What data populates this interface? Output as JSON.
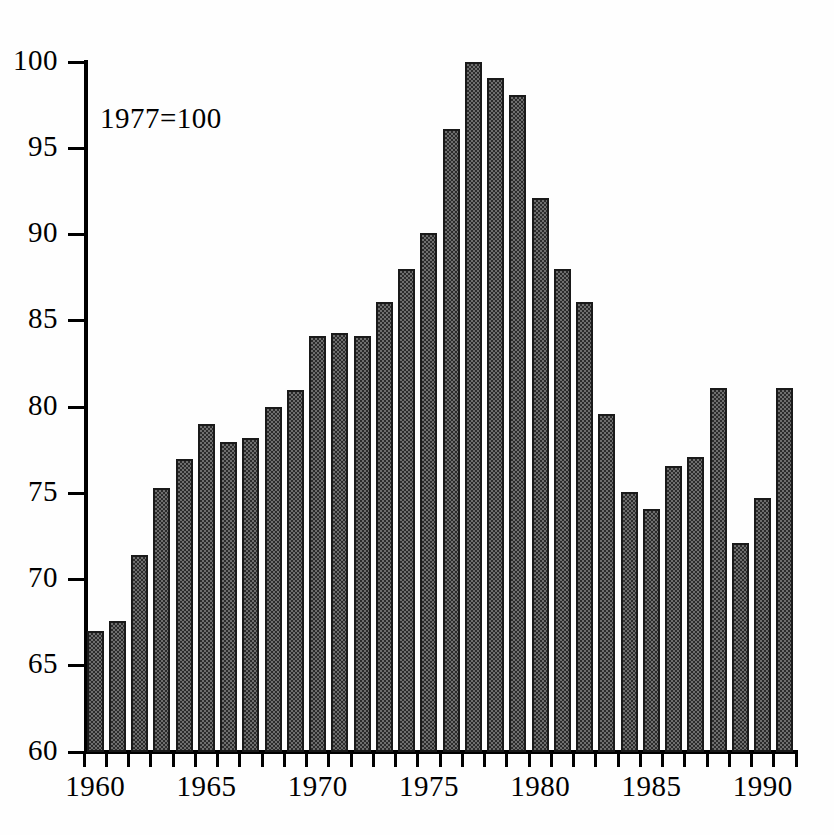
{
  "chart_data": {
    "type": "bar",
    "title": "",
    "subtitle": "",
    "annotation": "1977=100",
    "xlabel": "",
    "ylabel": "",
    "ylim": [
      60,
      100
    ],
    "ytick_values": [
      60,
      65,
      70,
      75,
      80,
      85,
      90,
      95,
      100
    ],
    "ytick_labels": [
      "60",
      "65",
      "70",
      "75",
      "80",
      "85",
      "90",
      "95",
      "100"
    ],
    "xlim": [
      1959.5,
      1991.5
    ],
    "xtick_values": [
      1960,
      1965,
      1970,
      1975,
      1980,
      1985,
      1990
    ],
    "xtick_labels": [
      "1960",
      "1965",
      "1970",
      "1975",
      "1980",
      "1985",
      "1990"
    ],
    "xtick_minor_every": 1,
    "grid": false,
    "legend": null,
    "baseline": 60,
    "bar_color": "#4a4a4a",
    "bar_edge_color": "#1a1a1a",
    "bar_fill_pattern": "checkered-dither",
    "categories": [
      "1960",
      "1961",
      "1962",
      "1963",
      "1964",
      "1965",
      "1966",
      "1967",
      "1968",
      "1969",
      "1970",
      "1971",
      "1972",
      "1973",
      "1974",
      "1975",
      "1976",
      "1977",
      "1978",
      "1979",
      "1980",
      "1981",
      "1982",
      "1983",
      "1984",
      "1985",
      "1986",
      "1987",
      "1988",
      "1989",
      "1990",
      "1991"
    ],
    "values": [
      67.0,
      67.6,
      71.4,
      75.3,
      77.0,
      79.0,
      78.0,
      78.2,
      80.0,
      81.0,
      84.1,
      84.3,
      84.1,
      86.1,
      88.0,
      90.1,
      96.1,
      100.0,
      99.1,
      98.1,
      92.1,
      88.0,
      86.1,
      79.6,
      75.1,
      74.1,
      76.6,
      77.1,
      81.1,
      72.1,
      74.7,
      81.1
    ]
  },
  "figure": {
    "background": "#ffffff",
    "axis_color": "#000000"
  }
}
